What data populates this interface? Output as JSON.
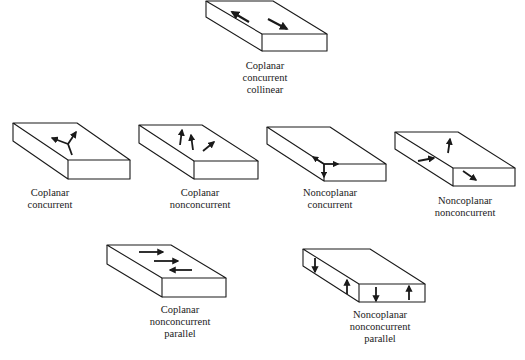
{
  "figures": [
    {
      "id": "coplanar-concurrent-collinear",
      "lines": [
        "Coplanar",
        "concurrent",
        "collinear"
      ]
    },
    {
      "id": "coplanar-concurrent",
      "lines": [
        "Coplanar",
        "concurrent"
      ]
    },
    {
      "id": "coplanar-nonconcurrent",
      "lines": [
        "Coplanar",
        "nonconcurrent"
      ]
    },
    {
      "id": "noncoplanar-concurrent",
      "lines": [
        "Noncoplanar",
        "concurrent"
      ]
    },
    {
      "id": "noncoplanar-nonconcurrent",
      "lines": [
        "Noncoplanar",
        "nonconcurrent"
      ]
    },
    {
      "id": "coplanar-nonconcurrent-parallel",
      "lines": [
        "Coplanar",
        "nonconcurrent",
        "parallel"
      ]
    },
    {
      "id": "noncoplanar-nonconcurrent-parallel",
      "lines": [
        "Noncoplanar",
        "nonconcurrent",
        "parallel"
      ]
    }
  ],
  "colors": {
    "line": "#1a1a1a",
    "background": "#ffffff"
  }
}
